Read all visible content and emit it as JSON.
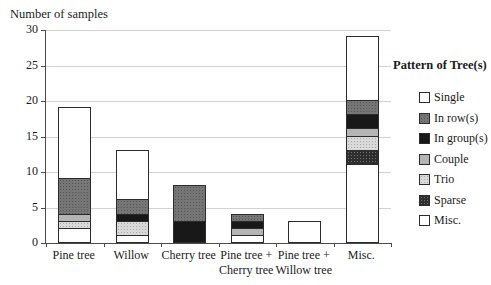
{
  "chart_data": {
    "type": "bar",
    "stacked": true,
    "title": "Number of samples",
    "ylabel": "Number of samples",
    "xlabel": "",
    "ylim": [
      0,
      30
    ],
    "yticks": [
      0,
      5,
      10,
      15,
      20,
      25,
      30
    ],
    "grid": true,
    "legend_position": "right",
    "legend_title": "Pattern of Tree(s)",
    "categories": [
      "Pine tree",
      "Willow",
      "Cherry tree",
      "Pine tree +\nCherry tree",
      "Pine tree +\nWillow tree",
      "Misc."
    ],
    "series": [
      {
        "name": "Single",
        "key": "single",
        "fill": "#ffffff",
        "values": [
          10,
          7,
          0,
          0,
          0,
          9
        ]
      },
      {
        "name": "In row(s)",
        "key": "in_rows",
        "fill": "#767676",
        "values": [
          5,
          2,
          5,
          1,
          0,
          2
        ]
      },
      {
        "name": "In group(s)",
        "key": "in_groups",
        "fill": "#181818",
        "values": [
          0,
          1,
          3,
          1,
          0,
          2
        ]
      },
      {
        "name": "Couple",
        "key": "couple",
        "fill": "#b4b4b4",
        "values": [
          1,
          0,
          0,
          1,
          0,
          1
        ]
      },
      {
        "name": "Trio",
        "key": "trio",
        "fill": "#d9d9d9",
        "values": [
          1,
          2,
          0,
          0,
          0,
          2
        ]
      },
      {
        "name": "Sparse",
        "key": "sparse",
        "fill": "#2e2e2e",
        "values": [
          0,
          0,
          0,
          0,
          0,
          2
        ]
      },
      {
        "name": "Misc.",
        "key": "misc",
        "fill": "#ffffff",
        "values": [
          2,
          1,
          0,
          1,
          3,
          11
        ]
      }
    ],
    "totals": [
      19,
      13,
      8,
      4,
      3,
      29
    ],
    "stack_order_bottom_to_top": [
      "Misc.",
      "Sparse",
      "Trio",
      "Couple",
      "In group(s)",
      "In row(s)",
      "Single"
    ],
    "colors": {
      "axis": "#4a4a4a",
      "gridline": "#d2d2d2",
      "segment_border": "#2b2b2b",
      "background": "#ffffff"
    }
  }
}
